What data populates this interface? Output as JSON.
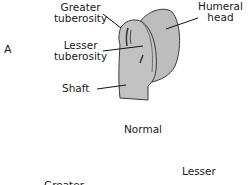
{
  "panel_letter": "A",
  "labels": {
    "greater_tuberosity": [
      "Greater",
      "tuberosity"
    ],
    "lesser_tuberosity": [
      "Lesser",
      "tuberosity"
    ],
    "shaft": "Shaft",
    "humeral_head": [
      "Humeral",
      "head"
    ]
  },
  "caption": "Normal",
  "next_panel_labels": {
    "lesser": "Lesser",
    "greater": "Greater"
  },
  "colors": {
    "bone_fill": "#b9b9b9",
    "outline": "#3a3a3a",
    "text": "#1a1a1a"
  }
}
